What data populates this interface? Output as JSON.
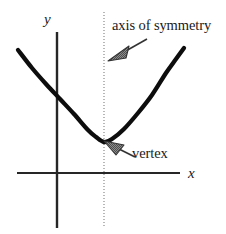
{
  "figure": {
    "labels": {
      "axis_of_symmetry": "axis of symmetry",
      "vertex": "vertex",
      "y_axis": "y",
      "x_axis": "x"
    },
    "colors": {
      "curve": "#0d0d0d",
      "axes": "#262626",
      "symmetry_line": "#9a9a9a",
      "arrow_fill": "#7a7a7a",
      "arrow_stroke": "#333333",
      "text": "#1a1a1a",
      "background": "#ffffff"
    }
  },
  "chart_data": {
    "type": "line",
    "xlabel": "x",
    "ylabel": "y",
    "grid": false,
    "legend": null,
    "axes": {
      "x_axis_pixel_y": 173,
      "x_axis_pixel_x_range": [
        17,
        180
      ],
      "y_axis_pixel_x": 57,
      "y_axis_pixel_y_range": [
        32,
        228
      ],
      "origin_pixel": [
        57,
        173
      ]
    },
    "annotations": [
      {
        "name": "axis-of-symmetry",
        "text": "axis of symmetry",
        "style": "dotted vertical line",
        "line_pixel_x": 104,
        "line_pixel_y_range": [
          12,
          228
        ],
        "arrow_from_pixel": [
          148,
          40
        ],
        "arrow_to_pixel": [
          110,
          60
        ]
      },
      {
        "name": "vertex",
        "text": "vertex",
        "point_pixel": [
          104,
          142
        ],
        "arrow_from_pixel": [
          136,
          158
        ],
        "arrow_to_pixel": [
          106,
          141
        ]
      }
    ],
    "series": [
      {
        "name": "parabola",
        "description": "upward-opening parabola, vertex on the axis of symmetry below the x-axis origin level",
        "vertex_pixel": [
          104,
          142
        ],
        "points_pixel": [
          [
            18,
            50
          ],
          [
            32,
            68
          ],
          [
            46,
            84
          ],
          [
            60,
            99
          ],
          [
            74,
            114
          ],
          [
            88,
            130
          ],
          [
            96,
            137
          ],
          [
            104,
            142
          ],
          [
            112,
            139
          ],
          [
            124,
            129
          ],
          [
            138,
            113
          ],
          [
            152,
            95
          ],
          [
            166,
            73
          ],
          [
            176,
            59
          ],
          [
            184,
            48
          ]
        ]
      }
    ]
  }
}
